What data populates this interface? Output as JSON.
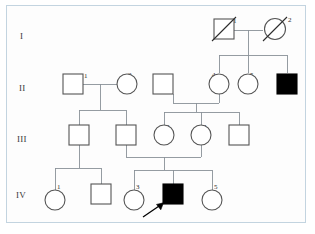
{
  "figure": {
    "type": "pedigree-chart",
    "title": "",
    "background_color": "#ffffff",
    "frame_color": "#c3d4e0",
    "line_color": "#8a9198",
    "symbol_stroke_color": "#555555",
    "affected_fill_color": "#000000",
    "unaffected_fill_color": "#ffffff"
  },
  "generations": [
    {
      "label": "I"
    },
    {
      "label": "II"
    },
    {
      "label": "III"
    },
    {
      "label": "IV"
    }
  ],
  "individuals": [
    {
      "id": "I-1",
      "number": "1",
      "sex": "male",
      "shape": "square",
      "affected": false,
      "deceased": true,
      "proband": false
    },
    {
      "id": "I-2",
      "number": "2",
      "sex": "female",
      "shape": "circle",
      "affected": false,
      "deceased": true,
      "proband": false
    },
    {
      "id": "II-1",
      "number": "1",
      "sex": "male",
      "shape": "square",
      "affected": false,
      "deceased": false,
      "proband": false
    },
    {
      "id": "II-2",
      "number": "2",
      "sex": "female",
      "shape": "circle",
      "affected": false,
      "deceased": false,
      "proband": false
    },
    {
      "id": "II-3",
      "number": "3",
      "sex": "male",
      "shape": "square",
      "affected": false,
      "deceased": false,
      "proband": false
    },
    {
      "id": "II-4",
      "number": "4",
      "sex": "female",
      "shape": "circle",
      "affected": false,
      "deceased": false,
      "proband": false
    },
    {
      "id": "II-5",
      "number": "5",
      "sex": "female",
      "shape": "circle",
      "affected": false,
      "deceased": false,
      "proband": false
    },
    {
      "id": "II-6",
      "number": "6",
      "sex": "male",
      "shape": "square",
      "affected": true,
      "deceased": false,
      "proband": false
    },
    {
      "id": "III-1",
      "number": "1",
      "sex": "male",
      "shape": "square",
      "affected": false,
      "deceased": false,
      "proband": false
    },
    {
      "id": "III-2",
      "number": "2",
      "sex": "male",
      "shape": "square",
      "affected": false,
      "deceased": false,
      "proband": false
    },
    {
      "id": "III-3",
      "number": "3",
      "sex": "female",
      "shape": "circle",
      "affected": false,
      "deceased": false,
      "proband": false
    },
    {
      "id": "III-4",
      "number": "4",
      "sex": "female",
      "shape": "circle",
      "affected": false,
      "deceased": false,
      "proband": false
    },
    {
      "id": "III-5",
      "number": "5",
      "sex": "male",
      "shape": "square",
      "affected": false,
      "deceased": false,
      "proband": false
    },
    {
      "id": "IV-1",
      "number": "1",
      "sex": "female",
      "shape": "circle",
      "affected": false,
      "deceased": false,
      "proband": false
    },
    {
      "id": "IV-2",
      "number": "2",
      "sex": "male",
      "shape": "square",
      "affected": false,
      "deceased": false,
      "proband": false
    },
    {
      "id": "IV-3",
      "number": "3",
      "sex": "female",
      "shape": "circle",
      "affected": false,
      "deceased": false,
      "proband": false
    },
    {
      "id": "IV-4",
      "number": "4",
      "sex": "male",
      "shape": "square",
      "affected": true,
      "deceased": false,
      "proband": true
    },
    {
      "id": "IV-5",
      "number": "5",
      "sex": "female",
      "shape": "circle",
      "affected": false,
      "deceased": false,
      "proband": false
    }
  ],
  "proband": {
    "marker_label": "P",
    "target": "IV-4"
  },
  "matings": [
    {
      "partners": [
        "I-1",
        "I-2"
      ],
      "children": [
        "II-4",
        "II-5",
        "II-6"
      ]
    },
    {
      "partners": [
        "II-1",
        "II-2"
      ],
      "children": [
        "III-1",
        "III-2"
      ]
    },
    {
      "partners": [
        "II-3",
        "II-4"
      ],
      "children": [
        "III-3",
        "III-4",
        "III-5"
      ]
    },
    {
      "partners": [
        "III-1"
      ],
      "children": [
        "IV-1",
        "IV-2"
      ]
    },
    {
      "partners": [
        "III-2",
        "III-4"
      ],
      "children": [
        "IV-3",
        "IV-4",
        "IV-5"
      ]
    }
  ],
  "labels": {
    "gen_1": "I",
    "gen_2": "II",
    "gen_3": "III",
    "gen_4": "IV",
    "n1": "1",
    "n2": "2",
    "n3": "3",
    "n4": "4",
    "n5": "5",
    "n6": "6",
    "proband_p": "P"
  }
}
